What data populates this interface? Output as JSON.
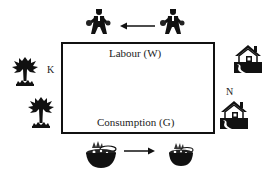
{
  "diagram": {
    "box": {
      "top_label": "Labour (W)",
      "bottom_label": "Consumption (G)",
      "border_color": "#111111"
    },
    "side_labels": {
      "left": "K",
      "right": "N"
    },
    "top_flow": {
      "icon": "worker-icon",
      "direction": "right-to-left",
      "count": 2
    },
    "bottom_flow": {
      "icon": "food-basket-icon",
      "direction": "left-to-right",
      "count": 2
    },
    "left_side": {
      "icon": "tree-icon",
      "count": 2
    },
    "right_side": {
      "icon": "house-icon",
      "count": 2
    }
  }
}
